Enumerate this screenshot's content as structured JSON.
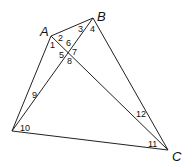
{
  "diagram": {
    "type": "geometry-quadrilateral-with-diagonals",
    "vertices": {
      "A": "A",
      "B": "B",
      "C": "C"
    },
    "angle_labels": [
      "1",
      "2",
      "3",
      "4",
      "5",
      "6",
      "7",
      "8",
      "9",
      "10",
      "11",
      "12"
    ]
  }
}
